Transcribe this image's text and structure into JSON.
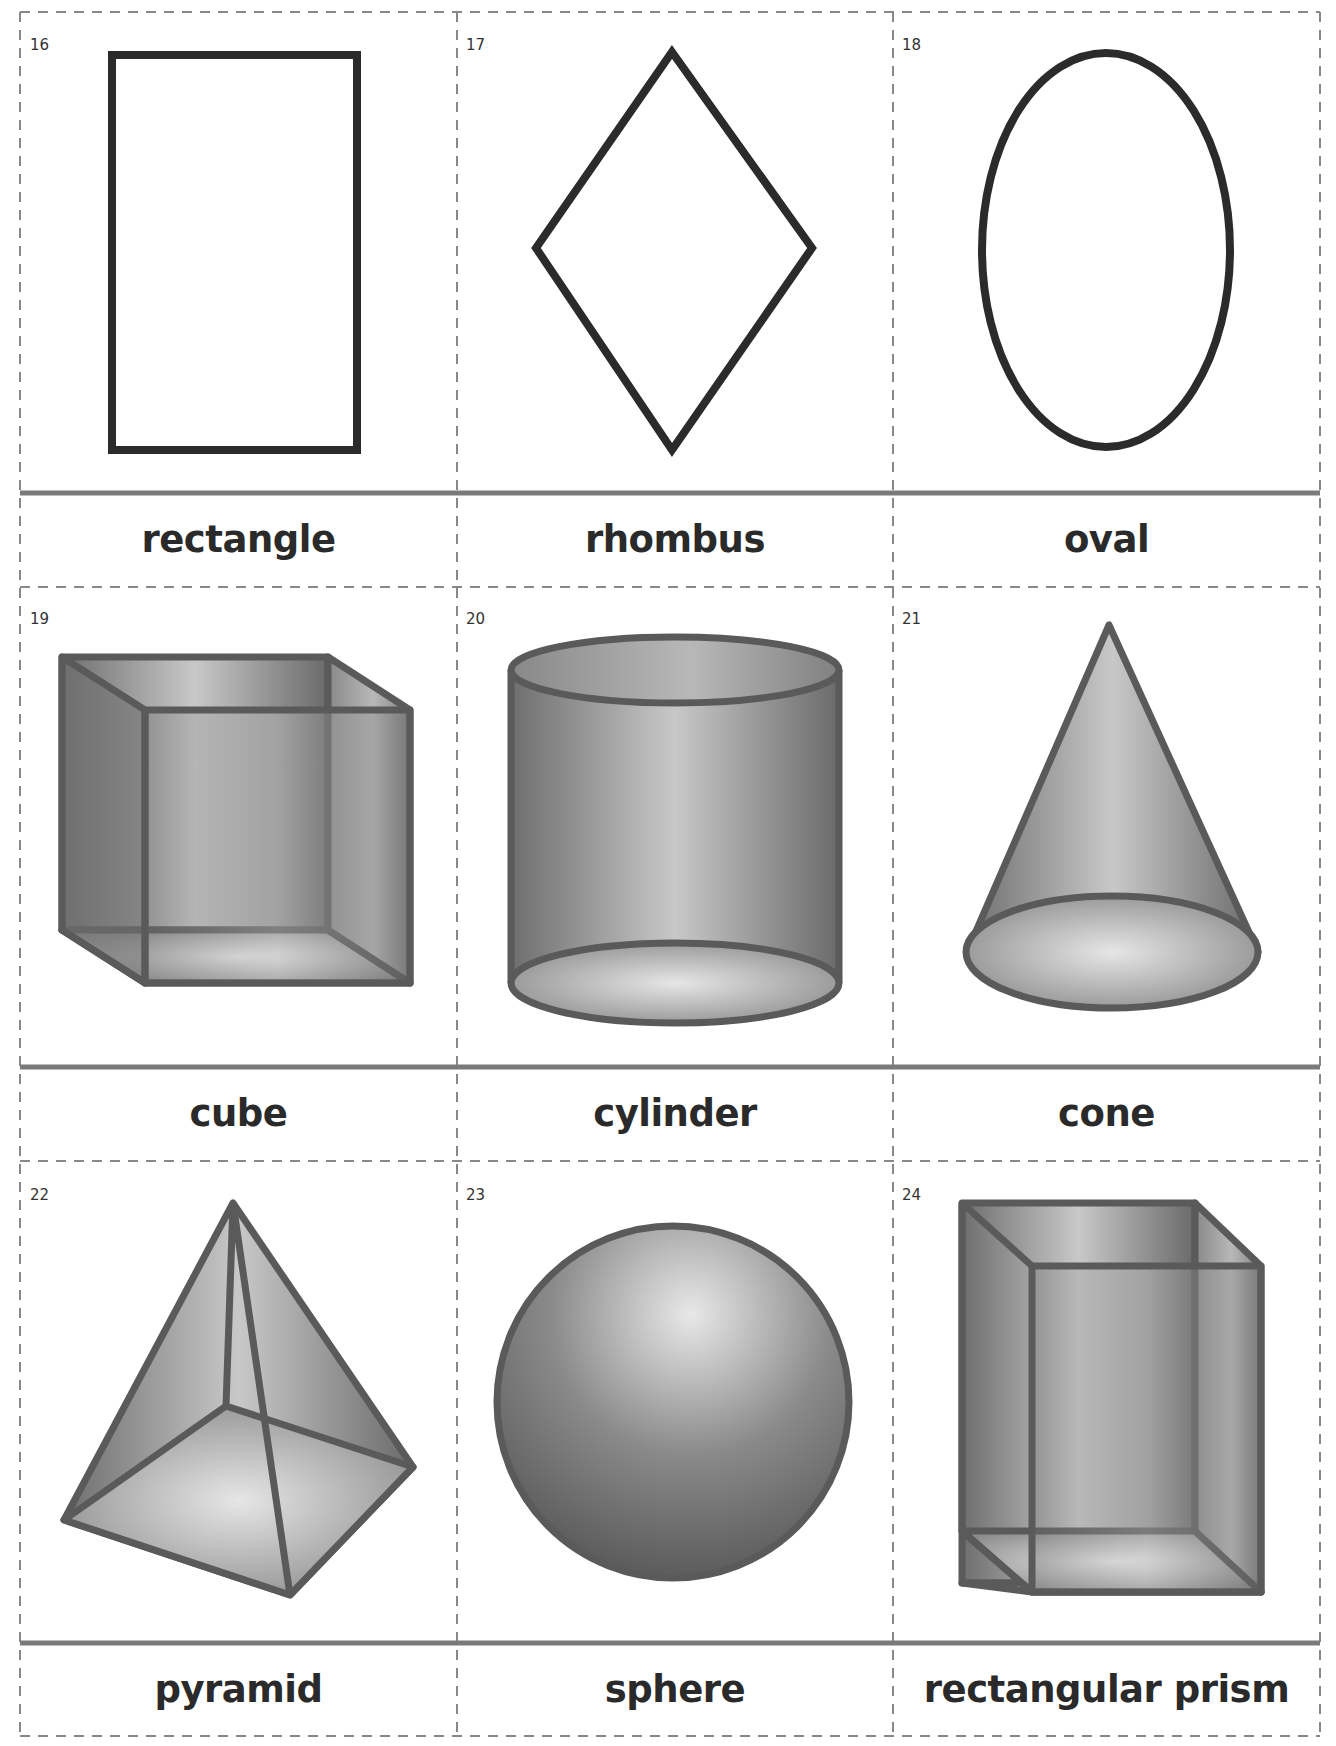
{
  "cards": [
    {
      "number": "16",
      "label": "rectangle",
      "shape": "rectangle-icon"
    },
    {
      "number": "17",
      "label": "rhombus",
      "shape": "rhombus-icon"
    },
    {
      "number": "18",
      "label": "oval",
      "shape": "oval-icon"
    },
    {
      "number": "19",
      "label": "cube",
      "shape": "cube-icon"
    },
    {
      "number": "20",
      "label": "cylinder",
      "shape": "cylinder-icon"
    },
    {
      "number": "21",
      "label": "cone",
      "shape": "cone-icon"
    },
    {
      "number": "22",
      "label": "pyramid",
      "shape": "pyramid-icon"
    },
    {
      "number": "23",
      "label": "sphere",
      "shape": "sphere-icon"
    },
    {
      "number": "24",
      "label": "rectangular prism",
      "shape": "rectangular-prism-icon"
    }
  ],
  "colors": {
    "outline_2d": "#2b2b2b",
    "outline_3d": "#5a5a5a",
    "divider": "#7a7a7a",
    "cut_line": "#888888"
  }
}
